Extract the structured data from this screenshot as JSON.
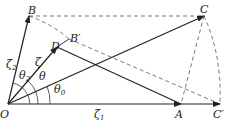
{
  "diagram": {
    "points": {
      "O": {
        "label": "O",
        "x": 8,
        "y": 104
      },
      "A": {
        "label": "A",
        "x": 181,
        "y": 104
      },
      "C_prime": {
        "label": "C′",
        "x": 220,
        "y": 104
      },
      "B": {
        "label": "B",
        "x": 29,
        "y": 16
      },
      "C": {
        "label": "C",
        "x": 204,
        "y": 16
      },
      "D": {
        "label": "D",
        "x": 57,
        "y": 47
      },
      "B_prime": {
        "label": "B′",
        "x": 69,
        "y": 39
      }
    },
    "vector_labels": {
      "zeta1": {
        "base": "ζ",
        "sub": "1"
      },
      "zeta2": {
        "base": "ζ",
        "sub": "2"
      },
      "zeta": {
        "base": "ζ"
      }
    },
    "angle_labels": {
      "theta": {
        "base": "θ"
      },
      "theta0": {
        "base": "θ",
        "sub": "0"
      },
      "theta2": {
        "base": "θ",
        "sub": "2"
      }
    },
    "colors": {
      "line": "#222222",
      "dashed": "#555555"
    }
  }
}
